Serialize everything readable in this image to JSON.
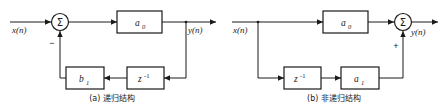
{
  "figure": {
    "background_color": "#ffffff",
    "line_color": "#1a1a1a",
    "panels": [
      {
        "id": "panel-a",
        "caption": "(a) 递归结构",
        "input_label": "x(n)",
        "output_label": "y(n)",
        "summer_symbol": "Σ",
        "summer_sign": "−",
        "blocks": [
          {
            "id": "gain-a0",
            "label": "a",
            "subscript": "0",
            "superscript": ""
          },
          {
            "id": "gain-b1",
            "label": "b",
            "subscript": "1",
            "superscript": ""
          },
          {
            "id": "delay-z",
            "label": "z",
            "subscript": "",
            "superscript": "-1"
          }
        ]
      },
      {
        "id": "panel-b",
        "caption": "(b) 非递归结构",
        "input_label": "x(n)",
        "output_label": "y(n)",
        "summer_symbol": "Σ",
        "summer_sign": "+",
        "blocks": [
          {
            "id": "gain-a0",
            "label": "a",
            "subscript": "0",
            "superscript": ""
          },
          {
            "id": "delay-z",
            "label": "z",
            "subscript": "",
            "superscript": "-1"
          },
          {
            "id": "gain-a1",
            "label": "a",
            "subscript": "1",
            "superscript": ""
          }
        ]
      }
    ]
  }
}
